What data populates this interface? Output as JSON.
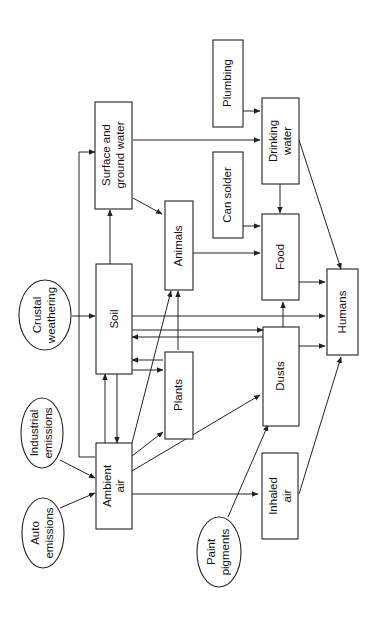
{
  "diagram": {
    "orientation": "rotated-90-ccw",
    "nodes": {
      "auto_emissions": {
        "line1": "Auto",
        "line2": "emissions",
        "shape": "ellipse"
      },
      "industrial_emissions": {
        "line1": "Industrial",
        "line2": "emissions",
        "shape": "ellipse"
      },
      "crustal_weathering": {
        "line1": "Crustal",
        "line2": "weathering",
        "shape": "ellipse"
      },
      "paint_pigments": {
        "line1": "Paint",
        "line2": "pigments",
        "shape": "ellipse"
      },
      "ambient_air": {
        "line1": "Ambient",
        "line2": "air",
        "shape": "box"
      },
      "soil": {
        "line1": "Soil",
        "shape": "box"
      },
      "surface_ground_water": {
        "line1": "Surface and",
        "line2": "ground water",
        "shape": "box"
      },
      "plants": {
        "line1": "Plants",
        "shape": "box"
      },
      "animals": {
        "line1": "Animals",
        "shape": "box"
      },
      "dusts": {
        "line1": "Dusts",
        "shape": "box"
      },
      "inhaled_air": {
        "line1": "Inhaled",
        "line2": "air",
        "shape": "box"
      },
      "food": {
        "line1": "Food",
        "shape": "box"
      },
      "can_solder": {
        "line1": "Can solder",
        "shape": "box"
      },
      "plumbing": {
        "line1": "Plumbing",
        "shape": "box"
      },
      "drinking_water": {
        "line1": "Drinking",
        "line2": "water",
        "shape": "box"
      },
      "humans": {
        "line1": "Humans",
        "shape": "box"
      }
    },
    "edges": [
      [
        "Auto emissions",
        "Ambient air"
      ],
      [
        "Industrial emissions",
        "Ambient air"
      ],
      [
        "Crustal weathering",
        "Soil"
      ],
      [
        "Paint pigments",
        "Dusts"
      ],
      [
        "Ambient air",
        "Soil"
      ],
      [
        "Soil",
        "Ambient air"
      ],
      [
        "Ambient air",
        "Surface and ground water"
      ],
      [
        "Ambient air",
        "Plants"
      ],
      [
        "Ambient air",
        "Animals"
      ],
      [
        "Ambient air",
        "Dusts"
      ],
      [
        "Ambient air",
        "Inhaled air"
      ],
      [
        "Soil",
        "Surface and ground water"
      ],
      [
        "Soil",
        "Plants"
      ],
      [
        "Plants",
        "Soil"
      ],
      [
        "Dusts",
        "Soil"
      ],
      [
        "Soil",
        "Dusts"
      ],
      [
        "Soil",
        "Humans"
      ],
      [
        "Plants",
        "Animals"
      ],
      [
        "Surface and ground water",
        "Animals"
      ],
      [
        "Surface and ground water",
        "Drinking water"
      ],
      [
        "Animals",
        "Food"
      ],
      [
        "Dusts",
        "Food"
      ],
      [
        "Dusts",
        "Humans"
      ],
      [
        "Can solder",
        "Food"
      ],
      [
        "Plumbing",
        "Drinking water"
      ],
      [
        "Drinking water",
        "Food"
      ],
      [
        "Drinking water",
        "Humans"
      ],
      [
        "Food",
        "Humans"
      ],
      [
        "Inhaled air",
        "Humans"
      ]
    ]
  }
}
